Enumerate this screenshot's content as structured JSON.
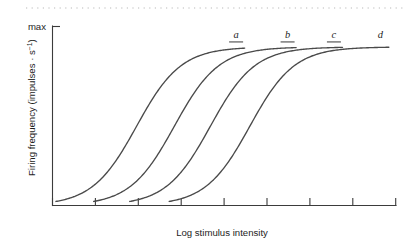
{
  "figure": {
    "background_color": "#ffffff",
    "line_color": "#4a4a4a",
    "axis_color": "#3b3b3b",
    "top_rule_color": "#b9b9b9"
  },
  "axes": {
    "y_label_main": "Firing frequency (impulses · s",
    "y_label_exponent": "−1",
    "y_label_close": ")",
    "y_max_tick_label": "max",
    "x_label": "Log stimulus intensity"
  },
  "chart_data": {
    "type": "line",
    "title": "",
    "xlabel": "Log stimulus intensity",
    "ylabel": "Firing frequency (impulses · s−1)",
    "xlim": [
      0,
      10
    ],
    "ylim": [
      0,
      1.05
    ],
    "grid": false,
    "legend": "inline-curve-labels",
    "x_ticks": [
      0,
      1,
      2,
      3,
      4,
      5,
      6,
      7,
      8
    ],
    "x_tick_labels": [
      "",
      "",
      "",
      "",
      "",
      "",
      "",
      "",
      ""
    ],
    "y_ticks": [
      1.0
    ],
    "y_tick_labels": [
      "max"
    ],
    "series": [
      {
        "name": "a",
        "label": "a",
        "label_x": 5.35,
        "label_y": 0.98,
        "midpoint_x": 2.45,
        "slope": 1.55,
        "x_start": 0.1,
        "x_end": 5.6,
        "plateau_y": 0.93
      },
      {
        "name": "b",
        "label": "b",
        "label_x": 6.85,
        "label_y": 0.98,
        "midpoint_x": 3.55,
        "slope": 1.55,
        "x_start": 1.2,
        "x_end": 7.1,
        "plateau_y": 0.93
      },
      {
        "name": "c",
        "label": "c",
        "label_x": 8.2,
        "label_y": 0.98,
        "midpoint_x": 4.6,
        "slope": 1.55,
        "x_start": 2.25,
        "x_end": 8.45,
        "plateau_y": 0.93
      },
      {
        "name": "d",
        "label": "d",
        "label_x": 9.55,
        "label_y": 0.98,
        "midpoint_x": 5.75,
        "slope": 1.55,
        "x_start": 3.4,
        "x_end": 9.8,
        "plateau_y": 0.93
      }
    ]
  }
}
